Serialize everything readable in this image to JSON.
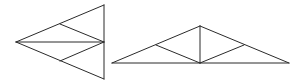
{
  "diagram": {
    "stroke_color": "#2a2a2a",
    "background": "#ffffff",
    "figures": [
      {
        "name": "left-triangle",
        "vertices": [
          [
            16,
            42
          ],
          [
            104,
            5
          ],
          [
            104,
            79
          ]
        ],
        "internal_points": [
          [
            60,
            24
          ],
          [
            60,
            61
          ]
        ],
        "segments": [
          [
            [
              16,
              42
            ],
            [
              104,
              5
            ]
          ],
          [
            [
              104,
              5
            ],
            [
              104,
              79
            ]
          ],
          [
            [
              104,
              79
            ],
            [
              16,
              42
            ]
          ],
          [
            [
              16,
              42
            ],
            [
              104,
              42
            ]
          ],
          [
            [
              60,
              24
            ],
            [
              104,
              42
            ]
          ],
          [
            [
              60,
              61
            ],
            [
              104,
              42
            ]
          ]
        ]
      },
      {
        "name": "right-triangle",
        "vertices": [
          [
            112,
            63
          ],
          [
            200,
            26
          ],
          [
            289,
            63
          ]
        ],
        "internal_points": [
          [
            156,
            45
          ],
          [
            244,
            45
          ]
        ],
        "segments": [
          [
            [
              112,
              63
            ],
            [
              200,
              26
            ]
          ],
          [
            [
              200,
              26
            ],
            [
              289,
              63
            ]
          ],
          [
            [
              112,
              63
            ],
            [
              289,
              63
            ]
          ],
          [
            [
              200,
              26
            ],
            [
              200,
              63
            ]
          ],
          [
            [
              156,
              45
            ],
            [
              200,
              63
            ]
          ],
          [
            [
              244,
              45
            ],
            [
              200,
              63
            ]
          ]
        ]
      }
    ]
  }
}
